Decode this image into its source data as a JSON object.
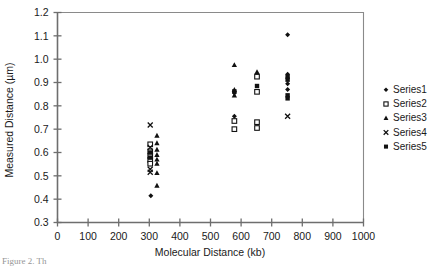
{
  "chart_data": {
    "type": "scatter",
    "title": "",
    "xlabel": "Molecular Distance (kb)",
    "ylabel": "Measured Distance (µm)",
    "xlim": [
      0,
      1000
    ],
    "ylim": [
      0.3,
      1.2
    ],
    "xticks": [
      0,
      100,
      200,
      300,
      400,
      500,
      600,
      700,
      800,
      900,
      1000
    ],
    "yticks": [
      0.3,
      0.4,
      0.5,
      0.6,
      0.7,
      0.8,
      0.9,
      1.0,
      1.1,
      1.2
    ],
    "xtick_labels": [
      "0",
      "100",
      "200",
      "300",
      "400",
      "500",
      "600",
      "700",
      "800",
      "900",
      "1000"
    ],
    "ytick_labels": [
      "0.3",
      "0.4",
      "0.5",
      "0.6",
      "0.7",
      "0.8",
      "0.9",
      "1.0",
      "1.1",
      "1.2"
    ],
    "grid": false,
    "legend_position": "right",
    "series": [
      {
        "name": "Series1",
        "marker": "diamond",
        "color": "#111111",
        "points": [
          [
            305,
            0.415
          ],
          [
            578,
            0.855
          ],
          [
            578,
            0.755
          ],
          [
            578,
            0.7
          ],
          [
            752,
            1.105
          ],
          [
            752,
            0.935
          ],
          [
            752,
            0.895
          ],
          [
            752,
            0.87
          ]
        ]
      },
      {
        "name": "Series2",
        "marker": "open-square",
        "color": "#111111",
        "points": [
          [
            303,
            0.635
          ],
          [
            303,
            0.605
          ],
          [
            303,
            0.585
          ],
          [
            303,
            0.568
          ],
          [
            303,
            0.552
          ],
          [
            578,
            0.735
          ],
          [
            578,
            0.7
          ],
          [
            652,
            0.925
          ],
          [
            652,
            0.86
          ],
          [
            652,
            0.73
          ],
          [
            652,
            0.705
          ]
        ]
      },
      {
        "name": "Series3",
        "marker": "triangle",
        "color": "#111111",
        "points": [
          [
            325,
            0.672
          ],
          [
            325,
            0.64
          ],
          [
            325,
            0.612
          ],
          [
            325,
            0.59
          ],
          [
            325,
            0.57
          ],
          [
            325,
            0.552
          ],
          [
            325,
            0.512
          ],
          [
            325,
            0.458
          ],
          [
            578,
            0.975
          ],
          [
            578,
            0.868
          ],
          [
            578,
            0.845
          ],
          [
            652,
            0.945
          ]
        ]
      },
      {
        "name": "Series4",
        "marker": "cross",
        "color": "#111111",
        "points": [
          [
            303,
            0.718
          ],
          [
            303,
            0.622
          ],
          [
            303,
            0.528
          ],
          [
            303,
            0.515
          ],
          [
            752,
            0.755
          ]
        ]
      },
      {
        "name": "Series5",
        "marker": "filled-square",
        "color": "#111111",
        "points": [
          [
            303,
            0.6
          ],
          [
            303,
            0.578
          ],
          [
            578,
            0.862
          ],
          [
            652,
            0.885
          ],
          [
            752,
            0.925
          ],
          [
            752,
            0.912
          ],
          [
            752,
            0.845
          ],
          [
            752,
            0.832
          ]
        ]
      }
    ]
  },
  "legend": {
    "entries": [
      {
        "label": "Series1"
      },
      {
        "label": "Series2"
      },
      {
        "label": "Series3"
      },
      {
        "label": "Series4"
      },
      {
        "label": "Series5"
      }
    ]
  },
  "caption": {
    "fragment": "Figure 2. Th"
  }
}
